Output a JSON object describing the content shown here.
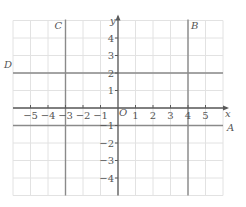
{
  "diagram": {
    "type": "coordinate-grid",
    "x_range": [
      -6,
      6
    ],
    "y_range": [
      -5,
      5
    ],
    "x_axis_label": "x",
    "y_axis_label": "y",
    "origin_label": "O",
    "x_ticks": [
      {
        "value": -5,
        "label": "−5"
      },
      {
        "value": -4,
        "label": "−4"
      },
      {
        "value": -3,
        "label": "−3"
      },
      {
        "value": -2,
        "label": "−2"
      },
      {
        "value": -1,
        "label": "−1"
      },
      {
        "value": 1,
        "label": "1"
      },
      {
        "value": 2,
        "label": "2"
      },
      {
        "value": 3,
        "label": "3"
      },
      {
        "value": 4,
        "label": "4"
      },
      {
        "value": 5,
        "label": "5"
      }
    ],
    "y_ticks": [
      {
        "value": 4,
        "label": "4"
      },
      {
        "value": 3,
        "label": "3"
      },
      {
        "value": 2,
        "label": "2"
      },
      {
        "value": 1,
        "label": "1"
      },
      {
        "value": -1,
        "label": "−1"
      },
      {
        "value": -2,
        "label": "−2"
      },
      {
        "value": -3,
        "label": "−3"
      },
      {
        "value": -4,
        "label": "−4"
      }
    ],
    "lines": [
      {
        "name": "A",
        "orientation": "horizontal",
        "value": -1
      },
      {
        "name": "B",
        "orientation": "vertical",
        "value": 4
      },
      {
        "name": "C",
        "orientation": "vertical",
        "value": -3
      },
      {
        "name": "D",
        "orientation": "horizontal",
        "value": 2
      }
    ],
    "colors": {
      "grid": "#e2e2e2",
      "line": "#8a8a8a",
      "axis": "#5a5a5a",
      "text": "#555555"
    }
  }
}
